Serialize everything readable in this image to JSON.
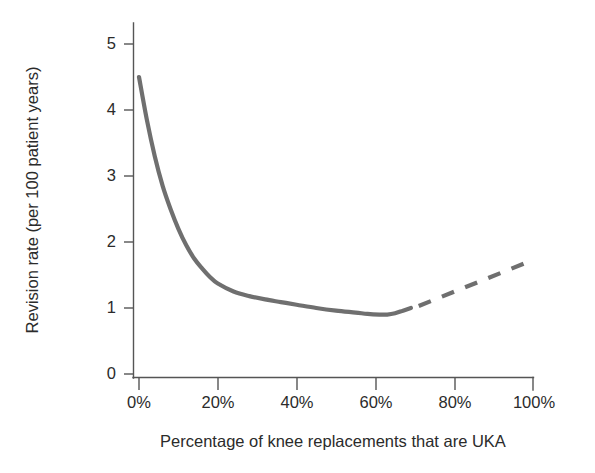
{
  "chart_data": {
    "type": "line",
    "title": "",
    "subtitle": "",
    "xlabel": "Percentage of knee replacements that are UKA",
    "ylabel": "Revision rate (per 100 patient years)",
    "xlim": [
      0,
      100
    ],
    "ylim": [
      0,
      5.4
    ],
    "xtick_labels": [
      "0%",
      "20%",
      "40%",
      "60%",
      "80%",
      "100%"
    ],
    "xticks": [
      0,
      20,
      40,
      60,
      80,
      100
    ],
    "ytick_labels": [
      "0",
      "1",
      "2",
      "3",
      "4",
      "5"
    ],
    "yticks": [
      0,
      1,
      2,
      3,
      4,
      5
    ],
    "grid": false,
    "legend": "none",
    "series": [
      {
        "name": "Observed revision rate",
        "style": "solid",
        "color": "#6f6f6f",
        "linewidth": 4.2,
        "x": [
          0,
          2,
          4,
          6,
          8,
          10,
          12,
          14,
          16,
          18,
          20,
          24,
          28,
          32,
          36,
          40,
          45,
          50,
          55,
          58,
          61,
          63,
          65,
          67,
          69
        ],
        "y": [
          4.5,
          3.85,
          3.3,
          2.85,
          2.5,
          2.2,
          1.95,
          1.75,
          1.6,
          1.47,
          1.37,
          1.25,
          1.18,
          1.13,
          1.09,
          1.05,
          1.0,
          0.96,
          0.93,
          0.91,
          0.9,
          0.9,
          0.92,
          0.96,
          1.0
        ]
      },
      {
        "name": "Extrapolated revision rate",
        "style": "dashed",
        "color": "#6f6f6f",
        "linewidth": 4.2,
        "dash_pattern": "13 12",
        "x": [
          71,
          98
        ],
        "y": [
          1.03,
          1.68
        ]
      }
    ],
    "annotations": []
  },
  "colors": {
    "line": "#6f6f6f",
    "axis": "#555555",
    "text": "#2b2b2b",
    "background": "#ffffff"
  }
}
